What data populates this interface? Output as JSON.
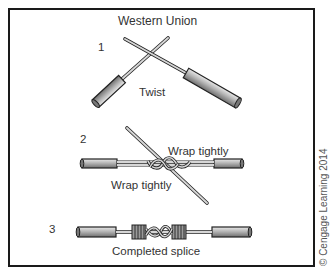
{
  "figure": {
    "title": "Western Union",
    "credit": "© Cengage Learning 2014",
    "steps": [
      {
        "number": "1",
        "labels": [
          "Twist"
        ]
      },
      {
        "number": "2",
        "labels": [
          "Wrap tightly",
          "Wrap tightly"
        ]
      },
      {
        "number": "3",
        "labels": [
          "Completed splice"
        ]
      }
    ]
  },
  "colors": {
    "frame": "#1a1a1a",
    "insulation": "#9a9a9a",
    "conductor": "#c8c8c8",
    "outline": "#222222",
    "text": "#333333"
  }
}
